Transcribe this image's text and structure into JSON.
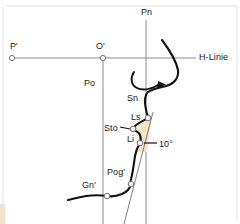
{
  "figure": {
    "kind": "cephalometric-soft-tissue-profile-diagram",
    "background_color": "#ffffff",
    "outline_color": "#111111",
    "reference_line_color": "#8d8d8d",
    "frame_color": "#e2ded6",
    "shade_color": "#f1e4c7",
    "marker_fill": "#ffffff",
    "marker_stroke": "#6f6f6f"
  },
  "labels": {
    "p_prime": "P'",
    "o_prime": "O'",
    "pn": "Pn",
    "h_linie": "H-Linie",
    "po": "Po",
    "sn": "Sn",
    "ls": "Ls",
    "sto": "Sto",
    "li": "Li",
    "pog_prime": "Pog'",
    "gn_prime": "Gn'",
    "angle": "10°"
  },
  "label_positions": {
    "p_prime": {
      "x": 10,
      "y": 42
    },
    "o_prime": {
      "x": 96,
      "y": 42
    },
    "pn": {
      "x": 141,
      "y": 8
    },
    "h_linie": {
      "x": 199,
      "y": 53
    },
    "po": {
      "x": 84,
      "y": 79
    },
    "sn": {
      "x": 127,
      "y": 94
    },
    "ls": {
      "x": 131,
      "y": 113
    },
    "sto": {
      "x": 104,
      "y": 124
    },
    "li": {
      "x": 127,
      "y": 135
    },
    "pog_prime": {
      "x": 107,
      "y": 168
    },
    "gn_prime": {
      "x": 82,
      "y": 181
    },
    "angle": {
      "x": 159,
      "y": 140
    }
  },
  "reference_lines": {
    "horizontal_h_line": {
      "name": "H-Linie",
      "x1": 12,
      "y1": 58,
      "x2": 196,
      "y2": 58
    },
    "vertical_po_line": {
      "name": "Po",
      "x1": 103,
      "y1": 58,
      "x2": 103,
      "y2": 224
    },
    "vertical_pn_line": {
      "name": "Pn",
      "x1": 146,
      "y1": 20,
      "x2": 146,
      "y2": 224
    },
    "lip_tangent_line": {
      "name": "lip-tangent",
      "x1": 153,
      "y1": 112,
      "x2": 124,
      "y2": 224
    }
  },
  "landmark_points": [
    {
      "name": "P'",
      "x": 12,
      "y": 58,
      "r": 2.6
    },
    {
      "name": "O'",
      "x": 103,
      "y": 58,
      "r": 2.6
    },
    {
      "name": "Ls",
      "x": 148,
      "y": 118,
      "r": 2.8
    },
    {
      "name": "Sto",
      "x": 133,
      "y": 129,
      "r": 2.8
    },
    {
      "name": "Li",
      "x": 140,
      "y": 143,
      "r": 2.8
    },
    {
      "name": "Pog'",
      "x": 131,
      "y": 184,
      "r": 2.8
    },
    {
      "name": "Gn'",
      "x": 107,
      "y": 196,
      "r": 2.8
    }
  ],
  "profile_outline": {
    "description": "soft tissue facial profile from glabella through nose, lips and chin",
    "path": "M162,40 C168,48 176,60 178,70 C179,78 174,84 166,86 C158,88 152,89 148,92 C146,94 145,98 145,101 C145,106 146,110 147,114 C148,116 149,117 148,118 C145,120 139,122 135,126 C133,128 133,129 134,130 C136,131 139,132 140,135 C141,138 141,141 140,143 C138,146 136,150 135,156 C134,163 133,172 131,179 C130,182 131,183 131,184 C130,188 127,192 122,194 C117,196 112,197 107,196 C100,195 93,195 86,196 C79,197 73,199 68,200"
  },
  "callout_arrow": {
    "description": "curved arrow pointing from under the nose toward the right",
    "path": "M134,72 C130,78 131,85 137,88 C143,91 151,89 158,85",
    "head": "158,81 166,84.5 157,88.5"
  },
  "shaded_region": {
    "description": "pale shaded wedge between the lip profile and the lip tangent line",
    "path": "M148,118 L152,116 L147,152 L136,152 C137,146 140,143 140,143 C141,138 141,132 138,131 C135,130 134,130 134,130 C135,128 140,123 145,120 Z"
  },
  "leaders": [
    {
      "name": "sto-leader",
      "x1": 120,
      "y1": 127,
      "x2": 130,
      "y2": 129
    },
    {
      "name": "angle-leader",
      "x1": 144,
      "y1": 143,
      "x2": 157,
      "y2": 143
    }
  ]
}
